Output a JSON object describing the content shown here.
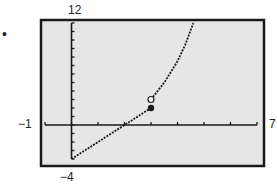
{
  "chart_data": {
    "type": "line",
    "title": "",
    "xlabel": "",
    "ylabel": "",
    "xlim": [
      -1,
      7
    ],
    "ylim": [
      -4,
      12
    ],
    "window_labels": {
      "xmin": "-1",
      "xmax": "7",
      "ymin": "-4",
      "ymax": "12"
    },
    "x_tick_step": 1,
    "y_tick_step": 1,
    "grid": false,
    "series": [
      {
        "name": "piece-1-linear",
        "x": [
          0,
          1,
          2,
          3
        ],
        "values": [
          -4,
          -2,
          0,
          2
        ],
        "style": "dotted",
        "endpoint": {
          "x": 3,
          "y": 2,
          "type": "closed"
        }
      },
      {
        "name": "piece-2-curve",
        "x": [
          3,
          3.5,
          4,
          4.3,
          4.6
        ],
        "values": [
          3,
          5,
          7.5,
          9.5,
          12
        ],
        "style": "dotted",
        "endpoint": {
          "x": 3,
          "y": 3,
          "type": "open"
        }
      }
    ]
  },
  "labels": {
    "bullet": "•",
    "ymax": "12",
    "ymin": "−4",
    "xmin": "−1",
    "xmax": "7"
  },
  "colors": {
    "plot_bg": "#e6e6e6",
    "ink": "#1a1a1a"
  }
}
